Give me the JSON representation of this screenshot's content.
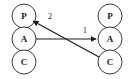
{
  "diagram": {
    "background_color": "#ffffff",
    "node_stroke_color": "#3a3a3a",
    "edge_color": "#1a1a1a",
    "label_color": "#1a1a1a",
    "columns": [
      {
        "id": "left-column",
        "name": "left-agent-stack",
        "center_x": 24,
        "nodes": [
          {
            "id": "left-p",
            "label": "P",
            "cx": 24,
            "cy": 16,
            "r": 12
          },
          {
            "id": "left-a",
            "label": "A",
            "cx": 24,
            "cy": 39,
            "r": 12
          },
          {
            "id": "left-c",
            "label": "C",
            "cx": 24,
            "cy": 62,
            "r": 12
          }
        ]
      },
      {
        "id": "right-column",
        "name": "right-agent-stack",
        "center_x": 110,
        "nodes": [
          {
            "id": "right-p",
            "label": "P",
            "cx": 110,
            "cy": 16,
            "r": 12
          },
          {
            "id": "right-a",
            "label": "A",
            "cx": 110,
            "cy": 39,
            "r": 12
          },
          {
            "id": "right-c",
            "label": "C",
            "cx": 110,
            "cy": 62,
            "r": 12
          }
        ]
      }
    ],
    "edges": [
      {
        "id": "edge-1",
        "name": "edge-left-a-to-right-a",
        "label": "1",
        "from": "left-a",
        "to": "right-a",
        "x1": 36,
        "y1": 39,
        "x2": 97,
        "y2": 39,
        "label_x": 85,
        "label_y": 30,
        "arrowhead": "end"
      },
      {
        "id": "edge-2",
        "name": "edge-right-c-to-left-p",
        "label": "2",
        "from": "right-c",
        "to": "left-p",
        "x1": 99,
        "y1": 57,
        "x2": 32,
        "y2": 21,
        "label_x": 50,
        "label_y": 16,
        "arrowhead": "end"
      }
    ]
  }
}
